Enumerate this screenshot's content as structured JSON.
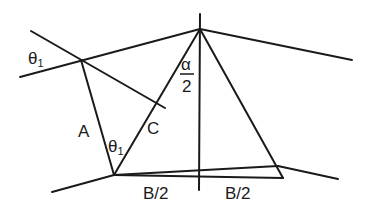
{
  "diagram": {
    "type": "geometric-construction",
    "labels": {
      "theta_outer": "θ",
      "theta_outer_sub": "1",
      "theta_inner": "θ",
      "theta_inner_sub": "1",
      "side_a": "A",
      "side_c": "C",
      "alpha_num": "α",
      "alpha_den": "2",
      "half_b_left": "B/2",
      "half_b_right": "B/2"
    },
    "colors": {
      "stroke": "#1a1a1a",
      "background": "#ffffff"
    }
  }
}
